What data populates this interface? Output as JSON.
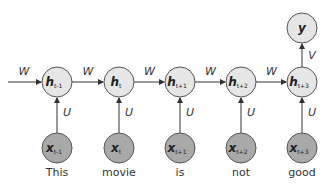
{
  "diagram": {
    "timesteps": [
      {
        "hidden": "h",
        "hidden_sub": "t-1",
        "input": "x",
        "input_sub": "t-1",
        "word": "This",
        "cx": 57
      },
      {
        "hidden": "h",
        "hidden_sub": "t",
        "input": "x",
        "input_sub": "t",
        "word": "movie",
        "cx": 119
      },
      {
        "hidden": "h",
        "hidden_sub": "t+1",
        "input": "x",
        "input_sub": "t+1",
        "word": "is",
        "cx": 180
      },
      {
        "hidden": "h",
        "hidden_sub": "t+2",
        "input": "x",
        "input_sub": "t+2",
        "word": "not",
        "cx": 241
      },
      {
        "hidden": "h",
        "hidden_sub": "t+3",
        "input": "x",
        "input_sub": "t+3",
        "word": "good",
        "cx": 302
      }
    ],
    "output": {
      "label": "y",
      "cx": 302
    },
    "edge_labels": {
      "recurrent": "W",
      "input": "U",
      "output": "V"
    },
    "colors": {
      "hidden_fill": "#e6e6e6",
      "input_fill": "#a9a9a9",
      "stroke": "#555555",
      "edge": "#333333"
    }
  }
}
